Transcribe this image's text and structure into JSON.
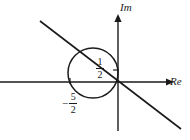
{
  "figure": {
    "axes": {
      "real": {
        "label": "Re",
        "name": "real-axis",
        "orientation": "horizontal",
        "y_pixel": 82,
        "x_start": 0,
        "x_end": 168,
        "arrow": "right"
      },
      "imaginary": {
        "label": "Im",
        "name": "imaginary-axis",
        "orientation": "vertical",
        "x_pixel": 118,
        "y_start": 16,
        "y_end": 131,
        "arrow": "up"
      }
    },
    "origin": {
      "x": 118,
      "y": 82
    },
    "circle": {
      "name": "circle",
      "center_x": 93,
      "center_y": 73,
      "radius": 25,
      "stroke": "#1a1a1a",
      "fill": "none"
    },
    "line": {
      "name": "diagonal-line",
      "x1": 40,
      "y1": 21,
      "x2": 181,
      "y2": 129,
      "stroke": "#1a1a1a"
    },
    "ticks": [
      {
        "name": "tick-imaginary-half",
        "axis": "imaginary",
        "x": 114,
        "y": 70,
        "length": 6
      },
      {
        "name": "tick-real-neg-five-halves",
        "axis": "real",
        "x": 70,
        "y": 79,
        "length": 6
      }
    ],
    "labels": {
      "imaginary_axis": "Im",
      "real_axis": "Re",
      "half": {
        "sign": "",
        "numerator": "1",
        "denominator": "2",
        "value": "1/2"
      },
      "neg_five_halves": {
        "sign": "−",
        "numerator": "5",
        "denominator": "2",
        "value": "-5/2"
      }
    },
    "colors": {
      "stroke": "#1a1a1a",
      "background": "#ffffff"
    }
  }
}
